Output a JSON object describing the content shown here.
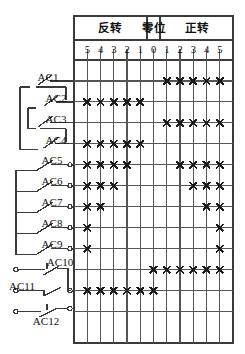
{
  "diagram": {
    "header_sections": [
      {
        "name": "reverse",
        "label": "反转",
        "span": 5
      },
      {
        "name": "zero",
        "label": "零位",
        "span": 1
      },
      {
        "name": "forward",
        "label": "正转",
        "span": 5
      }
    ],
    "column_numbers": [
      "5",
      "4",
      "3",
      "2",
      "1",
      "0",
      "1",
      "2",
      "3",
      "4",
      "5"
    ],
    "contacts": [
      {
        "name": "AC1",
        "type": "bracket-switch"
      },
      {
        "name": "AC2",
        "type": "bracket-switch"
      },
      {
        "name": "AC3",
        "type": "bracket-switch"
      },
      {
        "name": "AC4",
        "type": "bracket-switch"
      },
      {
        "name": "AC5",
        "type": "terminal-switch"
      },
      {
        "name": "AC6",
        "type": "terminal-switch"
      },
      {
        "name": "AC7",
        "type": "terminal-switch"
      },
      {
        "name": "AC8",
        "type": "terminal-switch"
      },
      {
        "name": "AC9",
        "type": "terminal-switch"
      },
      {
        "name": "AC10",
        "type": "linked-switch"
      },
      {
        "name": "AC11",
        "type": "linked-switch"
      },
      {
        "name": "AC12",
        "type": "linked-switch"
      }
    ],
    "marker_glyph": "×",
    "colors": {
      "line": "#3a3a3a",
      "grid": "#555555",
      "marker": "#1a1a1a",
      "background": "#ffffff"
    }
  },
  "chart_data": {
    "type": "table",
    "xlabel": "",
    "ylabel": "",
    "categories": [
      "5",
      "4",
      "3",
      "2",
      "1",
      "0",
      "1",
      "2",
      "3",
      "4",
      "5"
    ],
    "column_groups": [
      "反转",
      "反转",
      "反转",
      "反转",
      "反转",
      "零位",
      "正转",
      "正转",
      "正转",
      "正转",
      "正转"
    ],
    "rows": [
      {
        "name": "AC1",
        "closed": [
          0,
          0,
          0,
          0,
          0,
          0,
          1,
          1,
          1,
          1,
          1
        ]
      },
      {
        "name": "AC2",
        "closed": [
          1,
          1,
          1,
          1,
          1,
          0,
          0,
          0,
          0,
          0,
          0
        ]
      },
      {
        "name": "AC3",
        "closed": [
          0,
          0,
          0,
          0,
          0,
          0,
          1,
          1,
          1,
          1,
          1
        ]
      },
      {
        "name": "AC4",
        "closed": [
          1,
          1,
          1,
          1,
          1,
          0,
          0,
          0,
          0,
          0,
          0
        ]
      },
      {
        "name": "AC5",
        "closed": [
          1,
          1,
          1,
          1,
          0,
          0,
          0,
          1,
          1,
          1,
          1
        ]
      },
      {
        "name": "AC6",
        "closed": [
          1,
          1,
          1,
          0,
          0,
          0,
          0,
          0,
          1,
          1,
          1
        ]
      },
      {
        "name": "AC7",
        "closed": [
          1,
          1,
          0,
          0,
          0,
          0,
          0,
          0,
          0,
          1,
          1
        ]
      },
      {
        "name": "AC8",
        "closed": [
          1,
          0,
          0,
          0,
          0,
          0,
          0,
          0,
          0,
          0,
          1
        ]
      },
      {
        "name": "AC9",
        "closed": [
          1,
          0,
          0,
          0,
          0,
          0,
          0,
          0,
          0,
          0,
          1
        ]
      },
      {
        "name": "AC10",
        "closed": [
          0,
          0,
          0,
          0,
          0,
          1,
          1,
          1,
          1,
          1,
          1
        ]
      },
      {
        "name": "AC11",
        "closed": [
          1,
          1,
          1,
          1,
          1,
          1,
          0,
          0,
          0,
          0,
          0
        ]
      },
      {
        "name": "AC12",
        "closed": [
          0,
          0,
          0,
          0,
          0,
          0,
          0,
          0,
          0,
          0,
          0
        ]
      }
    ],
    "legend": [
      "× = 触头闭合"
    ],
    "grid": true
  }
}
